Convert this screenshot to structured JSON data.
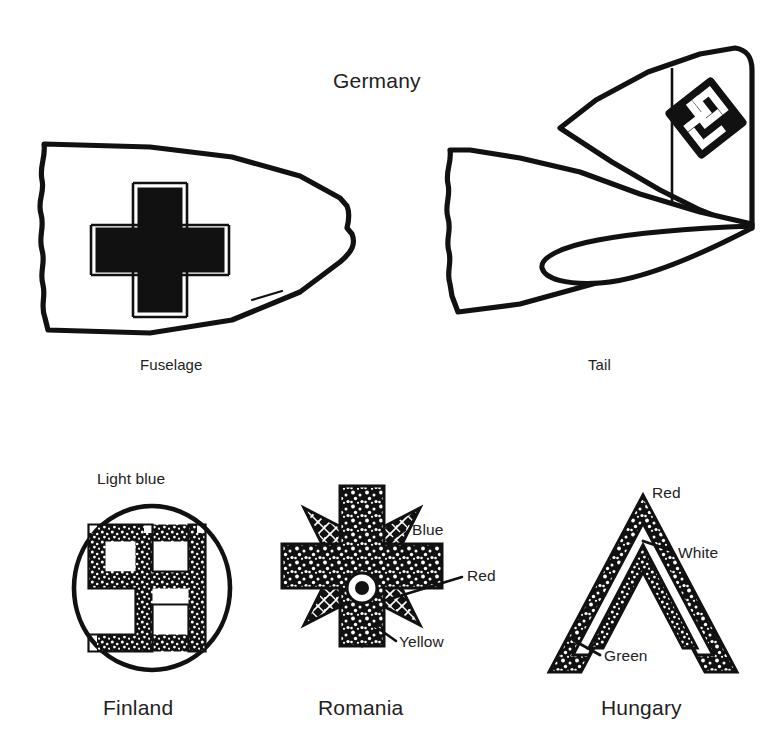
{
  "figure": {
    "background_color": "#ffffff",
    "ink_color": "#111111",
    "section_title": "Germany"
  },
  "germany": {
    "title": "Germany",
    "parts": [
      {
        "label": "Fuselage",
        "marking": "balkenkreuz-cross"
      },
      {
        "label": "Tail",
        "marking": "hakenkreuz-fin-marking"
      }
    ]
  },
  "markings": [
    {
      "country": "Finland",
      "shape": "circle-roundel-with-hooked-cross",
      "colors": [
        {
          "name": "Light blue",
          "hex": "#9ec9e8"
        }
      ]
    },
    {
      "country": "Romania",
      "shape": "michael-cross-eight-point-star",
      "colors": [
        {
          "name": "Blue",
          "hex": "#2d4fa0"
        },
        {
          "name": "Red",
          "hex": "#c8202a"
        },
        {
          "name": "Yellow",
          "hex": "#f2c800"
        }
      ]
    },
    {
      "country": "Hungary",
      "shape": "chevron-three-band",
      "colors": [
        {
          "name": "Red",
          "hex": "#c8202a"
        },
        {
          "name": "White",
          "hex": "#ffffff"
        },
        {
          "name": "Green",
          "hex": "#2f7d32"
        }
      ]
    }
  ],
  "labels": {
    "germany": "Germany",
    "fuselage": "Fuselage",
    "tail": "Tail",
    "light_blue": "Light blue",
    "finland": "Finland",
    "blue": "Blue",
    "red_romania": "Red",
    "yellow": "Yellow",
    "romania": "Romania",
    "red_hungary": "Red",
    "white": "White",
    "green": "Green",
    "hungary": "Hungary"
  }
}
